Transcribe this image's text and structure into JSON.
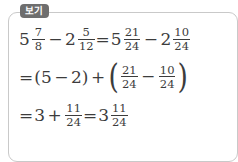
{
  "box": {
    "label": "보기",
    "label_meaning": "example",
    "border_color": "#c9c9c9",
    "badge_color": "#6e6e6e",
    "text_color": "#3c3c3c",
    "background_color": "#ffffff"
  },
  "problem": {
    "expression": "5 7/8 − 2 5/12",
    "answer": "3 11/24"
  },
  "lines": [
    {
      "id": "line-1",
      "text": "5 7/8 − 2 5/12 = 5 21/24 − 2 10/24",
      "a_whole": "5",
      "a_num": "7",
      "a_den": "8",
      "minus": "−",
      "b_whole": "2",
      "b_num": "5",
      "b_den": "12",
      "equals": "=",
      "c_whole": "5",
      "c_num": "21",
      "c_den": "24",
      "minus2": "−",
      "d_whole": "2",
      "d_num": "10",
      "d_den": "24"
    },
    {
      "id": "line-2",
      "text": "= (5 − 2) + ( 21/24 − 10/24 )",
      "equals": "=",
      "paren_open": "(",
      "x1": "5",
      "minus": "−",
      "x2": "2",
      "paren_close": ")",
      "plus": "+",
      "big_open": "(",
      "e_num": "21",
      "e_den": "24",
      "minus2": "−",
      "f_num": "10",
      "f_den": "24",
      "big_close": ")"
    },
    {
      "id": "line-3",
      "text": "= 3 + 11/24 = 3 11/24",
      "equals": "=",
      "g_whole": "3",
      "plus": "+",
      "h_num": "11",
      "h_den": "24",
      "equals2": "=",
      "i_whole": "3",
      "i_num": "11",
      "i_den": "24"
    }
  ]
}
